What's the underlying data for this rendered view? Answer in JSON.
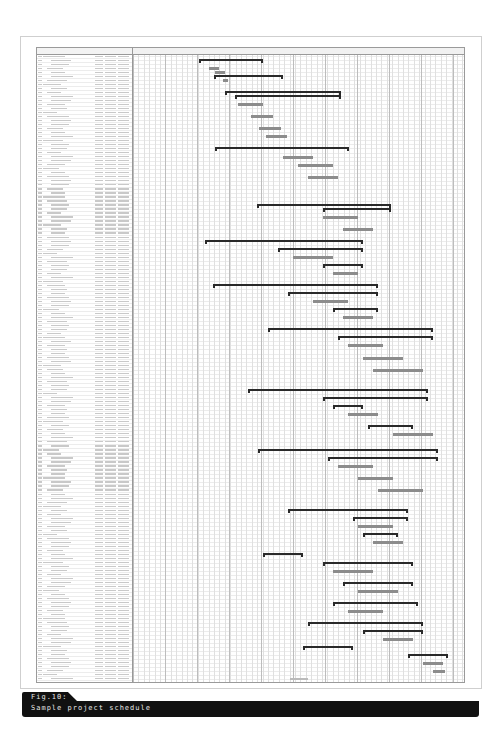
{
  "figure": {
    "number_label": "Fig.10:",
    "title": "Sample project schedule"
  },
  "gantt": {
    "row_count": 157,
    "note": "Table text is illegible at this resolution; task names, dates and durations not transcribable.",
    "colors": {
      "summary_bar": "#2a2a2a",
      "task_bar": "#8c8c8c",
      "grid_major": "#bdbdbd",
      "grid_minor": "#e0e0e0",
      "caption_bg": "#111111",
      "caption_text": "#e8e8e8"
    },
    "bars": [
      {
        "row": 1,
        "start": 66,
        "end": 130,
        "type": "summary"
      },
      {
        "row": 3,
        "start": 76,
        "end": 86,
        "type": "task"
      },
      {
        "row": 4,
        "start": 82,
        "end": 92,
        "type": "task"
      },
      {
        "row": 5,
        "start": 81,
        "end": 150,
        "type": "summary"
      },
      {
        "row": 6,
        "start": 90,
        "end": 95,
        "type": "task"
      },
      {
        "row": 9,
        "start": 92,
        "end": 208,
        "type": "summary"
      },
      {
        "row": 10,
        "start": 102,
        "end": 208,
        "type": "summary"
      },
      {
        "row": 12,
        "start": 105,
        "end": 130,
        "type": "task"
      },
      {
        "row": 15,
        "start": 118,
        "end": 140,
        "type": "task"
      },
      {
        "row": 18,
        "start": 126,
        "end": 148,
        "type": "task"
      },
      {
        "row": 20,
        "start": 133,
        "end": 154,
        "type": "task"
      },
      {
        "row": 23,
        "start": 82,
        "end": 216,
        "type": "summary"
      },
      {
        "row": 25,
        "start": 150,
        "end": 180,
        "type": "task"
      },
      {
        "row": 27,
        "start": 165,
        "end": 200,
        "type": "task"
      },
      {
        "row": 30,
        "start": 175,
        "end": 205,
        "type": "task"
      },
      {
        "row": 37,
        "start": 124,
        "end": 258,
        "type": "summary"
      },
      {
        "row": 38,
        "start": 190,
        "end": 258,
        "type": "summary"
      },
      {
        "row": 40,
        "start": 190,
        "end": 225,
        "type": "task"
      },
      {
        "row": 43,
        "start": 210,
        "end": 240,
        "type": "task"
      },
      {
        "row": 46,
        "start": 72,
        "end": 230,
        "type": "summary"
      },
      {
        "row": 48,
        "start": 145,
        "end": 230,
        "type": "summary"
      },
      {
        "row": 50,
        "start": 160,
        "end": 200,
        "type": "task"
      },
      {
        "row": 52,
        "start": 190,
        "end": 230,
        "type": "summary"
      },
      {
        "row": 54,
        "start": 200,
        "end": 225,
        "type": "task"
      },
      {
        "row": 57,
        "start": 80,
        "end": 245,
        "type": "summary"
      },
      {
        "row": 59,
        "start": 155,
        "end": 245,
        "type": "summary"
      },
      {
        "row": 61,
        "start": 180,
        "end": 215,
        "type": "task"
      },
      {
        "row": 63,
        "start": 200,
        "end": 245,
        "type": "summary"
      },
      {
        "row": 65,
        "start": 210,
        "end": 240,
        "type": "task"
      },
      {
        "row": 68,
        "start": 135,
        "end": 300,
        "type": "summary"
      },
      {
        "row": 70,
        "start": 205,
        "end": 300,
        "type": "summary"
      },
      {
        "row": 72,
        "start": 215,
        "end": 250,
        "type": "task"
      },
      {
        "row": 75,
        "start": 230,
        "end": 270,
        "type": "task"
      },
      {
        "row": 78,
        "start": 240,
        "end": 290,
        "type": "task"
      },
      {
        "row": 83,
        "start": 115,
        "end": 295,
        "type": "summary"
      },
      {
        "row": 85,
        "start": 190,
        "end": 295,
        "type": "summary"
      },
      {
        "row": 87,
        "start": 200,
        "end": 230,
        "type": "summary"
      },
      {
        "row": 89,
        "start": 215,
        "end": 245,
        "type": "task"
      },
      {
        "row": 92,
        "start": 235,
        "end": 280,
        "type": "summary"
      },
      {
        "row": 94,
        "start": 260,
        "end": 300,
        "type": "task"
      },
      {
        "row": 98,
        "start": 125,
        "end": 305,
        "type": "summary"
      },
      {
        "row": 100,
        "start": 195,
        "end": 305,
        "type": "summary"
      },
      {
        "row": 102,
        "start": 205,
        "end": 240,
        "type": "task"
      },
      {
        "row": 105,
        "start": 225,
        "end": 260,
        "type": "task"
      },
      {
        "row": 108,
        "start": 245,
        "end": 290,
        "type": "task"
      },
      {
        "row": 113,
        "start": 155,
        "end": 275,
        "type": "summary"
      },
      {
        "row": 115,
        "start": 220,
        "end": 275,
        "type": "summary"
      },
      {
        "row": 117,
        "start": 225,
        "end": 260,
        "type": "task"
      },
      {
        "row": 119,
        "start": 230,
        "end": 265,
        "type": "summary"
      },
      {
        "row": 121,
        "start": 240,
        "end": 270,
        "type": "task"
      },
      {
        "row": 124,
        "start": 130,
        "end": 170,
        "type": "summary"
      },
      {
        "row": 126,
        "start": 190,
        "end": 280,
        "type": "summary"
      },
      {
        "row": 128,
        "start": 200,
        "end": 240,
        "type": "task"
      },
      {
        "row": 131,
        "start": 210,
        "end": 280,
        "type": "summary"
      },
      {
        "row": 133,
        "start": 225,
        "end": 265,
        "type": "task"
      },
      {
        "row": 136,
        "start": 200,
        "end": 285,
        "type": "summary"
      },
      {
        "row": 138,
        "start": 215,
        "end": 250,
        "type": "task"
      },
      {
        "row": 141,
        "start": 175,
        "end": 290,
        "type": "summary"
      },
      {
        "row": 143,
        "start": 230,
        "end": 290,
        "type": "summary"
      },
      {
        "row": 145,
        "start": 250,
        "end": 280,
        "type": "task"
      },
      {
        "row": 147,
        "start": 170,
        "end": 220,
        "type": "summary"
      },
      {
        "row": 149,
        "start": 275,
        "end": 315,
        "type": "summary"
      },
      {
        "row": 151,
        "start": 290,
        "end": 310,
        "type": "task"
      },
      {
        "row": 153,
        "start": 300,
        "end": 312,
        "type": "task"
      }
    ]
  }
}
